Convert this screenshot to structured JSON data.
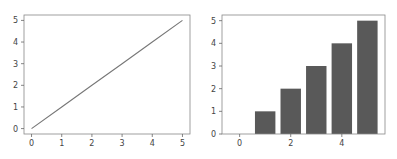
{
  "chart_data": [
    {
      "type": "line",
      "title": "",
      "xlabel": "",
      "ylabel": "",
      "x": [
        0,
        1,
        2,
        3,
        4,
        5
      ],
      "series": [
        {
          "name": "line",
          "values": [
            0,
            1,
            2,
            3,
            4,
            5
          ],
          "color": "#777777"
        }
      ],
      "xticks": [
        "0",
        "1",
        "2",
        "3",
        "4",
        "5"
      ],
      "yticks": [
        "0",
        "1",
        "2",
        "3",
        "4",
        "5"
      ],
      "xlim": [
        -0.25,
        5.25
      ],
      "ylim": [
        -0.25,
        5.25
      ],
      "grid": false
    },
    {
      "type": "bar",
      "title": "",
      "xlabel": "",
      "ylabel": "",
      "categories": [
        0,
        1,
        2,
        3,
        4,
        5
      ],
      "values": [
        0,
        1,
        2,
        3,
        4,
        5
      ],
      "color": "#595959",
      "xticks": [
        "0",
        "2",
        "4"
      ],
      "yticks": [
        "0",
        "1",
        "2",
        "3",
        "4",
        "5"
      ],
      "xlim": [
        -0.69,
        5.69
      ],
      "ylim": [
        0,
        5.25
      ],
      "grid": false
    }
  ]
}
